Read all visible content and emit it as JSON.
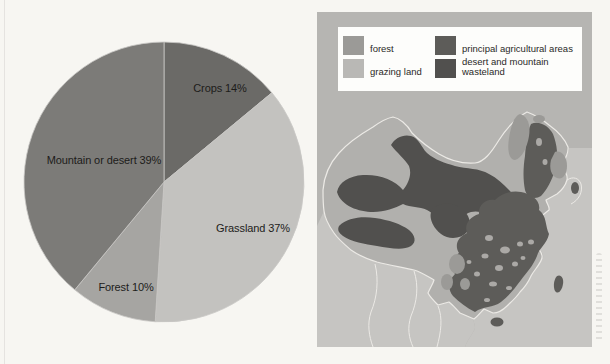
{
  "page": {
    "background_color": "#f7f6f2",
    "description_texts": []
  },
  "chart_data": {
    "type": "pie",
    "title": "",
    "label_format": "{label} {value}%",
    "start_angle_deg_from_top": 0,
    "direction": "clockwise",
    "slices": [
      {
        "label": "Crops",
        "value": 14,
        "color": "#6b6a67",
        "label_x": 220,
        "label_y": 92
      },
      {
        "label": "Grassland",
        "value": 37,
        "color": "#c3c2bf",
        "label_x": 253,
        "label_y": 232
      },
      {
        "label": "Forest",
        "value": 10,
        "color": "#a6a5a2",
        "label_x": 126,
        "label_y": 291
      },
      {
        "label": "Mountain or desert",
        "value": 39,
        "color": "#7c7b78",
        "label_x": 104,
        "label_y": 164
      }
    ],
    "slice_edge_color": "#c9c8c5"
  },
  "map": {
    "legend": {
      "items": [
        {
          "label": "forest",
          "color": "#9b9a97"
        },
        {
          "label": "grazing land",
          "color": "#b9b8b5"
        },
        {
          "label": "principal agricultural areas",
          "color": "#5d5c59"
        },
        {
          "label": "desert and mountain wasteland",
          "color": "#51504e"
        }
      ]
    },
    "colors": {
      "background": "#b6b5b2",
      "sea_and_outside_land": "#c6c5c2",
      "grazing_land": "#b1b0ad",
      "forest": "#9b9a97",
      "agricultural": "#5d5c59",
      "desert_wasteland": "#51504e",
      "hole_patch": "#aba9a6",
      "border_line": "#eceae6",
      "legend_box": "#fdfdfb"
    }
  }
}
